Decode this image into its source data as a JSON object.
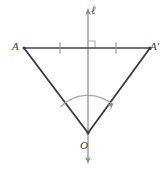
{
  "figure": {
    "kind": "geometry-diagram",
    "width": 166,
    "height": 169,
    "background": "#ffffff"
  },
  "colors": {
    "axis": "#8c8c8c",
    "segment": "#444444",
    "triangle": "#3a3a3a",
    "arc": "#a0a0a0",
    "tick": "#9a9a9a",
    "right_angle": "#b0b0b0",
    "label": "#3b3b3b"
  },
  "labels": {
    "axis_line": "ℓ",
    "point_a": "A",
    "point_a_prime": "A′",
    "center_o": "O"
  },
  "geometry": {
    "axis": {
      "name": "vertical-axis-line",
      "x": 88,
      "y_top": 9,
      "y_bottom": 163,
      "arrow_top": true,
      "arrow_bottom": true
    },
    "segment_aa_prime": {
      "name": "segment-a-to-a-prime",
      "x1": 24,
      "y1": 48,
      "x2": 150,
      "y2": 48
    },
    "points": {
      "A": {
        "x": 24,
        "y": 48
      },
      "A_prime": {
        "x": 150,
        "y": 48
      },
      "O": {
        "x": 88,
        "y": 133
      },
      "midpoint": {
        "x": 88,
        "y": 48
      }
    },
    "tick_marks": [
      {
        "x": 60,
        "y": 48
      },
      {
        "x": 116,
        "y": 48
      }
    ],
    "right_angle_mark": {
      "x": 88,
      "y": 48,
      "size": 7,
      "orientation": "upper-right"
    },
    "angle_arc": {
      "center_x": 88,
      "center_y": 133,
      "radius": 38,
      "arrow_at": "end"
    }
  }
}
